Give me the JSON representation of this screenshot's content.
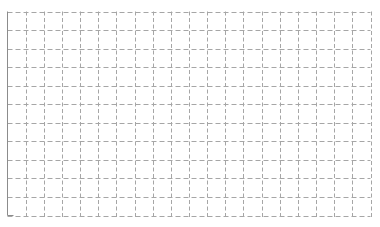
{
  "chart_data": {
    "type": "line",
    "title": "",
    "xlabel": "",
    "ylabel": "",
    "categories": [],
    "series": [],
    "grid": true,
    "grid_style": "dashed",
    "x_divisions": 20,
    "y_divisions": 11,
    "legend": null,
    "plot_area": {
      "left": 7.5,
      "top": 11.5,
      "right": 370.5,
      "bottom": 215.5
    },
    "colors": {
      "background": "#ffffff",
      "grid": "#a6a6a6",
      "axis": "#8c8c8c"
    }
  }
}
